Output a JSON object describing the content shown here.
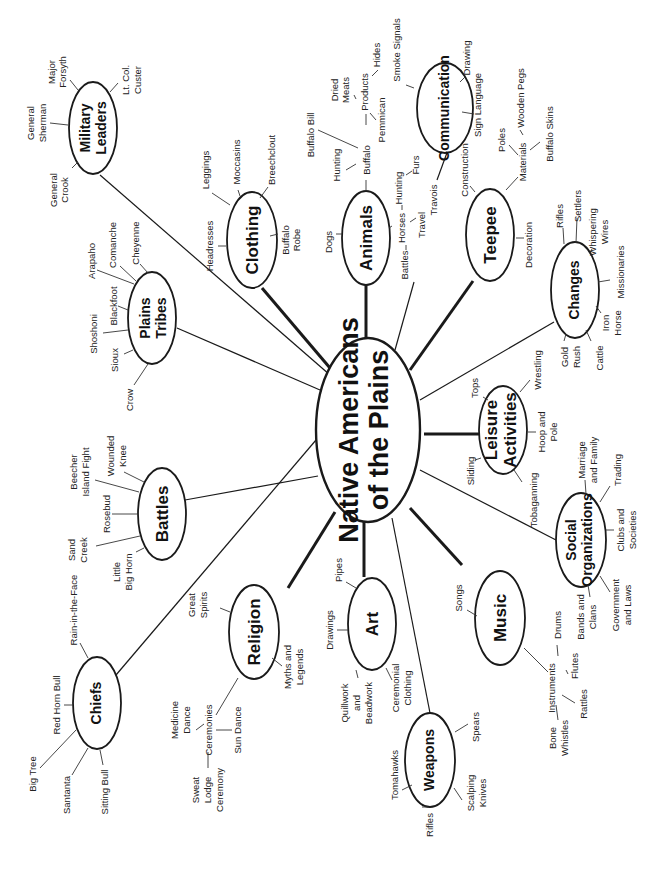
{
  "diagram": {
    "title_line1": "Native Americans",
    "title_line2": "of the Plains",
    "orientation": "rotated 90 degrees counter-clockwise",
    "colors": {
      "ink": "#1a1a1a",
      "background": "#ffffff"
    }
  },
  "nodes": {
    "military_leaders": {
      "line1": "Military",
      "line2": "Leaders",
      "children": [
        "General Crook",
        "General Sherman",
        "Major Forsyth",
        "Lt. Col. Custer"
      ]
    },
    "plains_tribes": {
      "line1": "Plains",
      "line2": "Tribes",
      "children": [
        "Crow",
        "Sioux",
        "Shoshoni",
        "Blackfoot",
        "Arapaho",
        "Comanche",
        "Cheyenne"
      ]
    },
    "clothing": {
      "label": "Clothing",
      "children": [
        "Headresses",
        "Leggings",
        "Moccasins",
        "Breechclout",
        "Buffalo Robe"
      ]
    },
    "animals": {
      "label": "Animals",
      "children": [
        "Dogs",
        "Buffalo",
        "Horses"
      ]
    },
    "buffalo": {
      "children": [
        "Hunting",
        "Buffalo Bill",
        "Products"
      ]
    },
    "products": {
      "children": [
        "Dried Meats",
        "Hides",
        "Pemmican"
      ]
    },
    "horses": {
      "children": [
        "Hunting",
        "Furs",
        "Travel",
        "Battles"
      ]
    },
    "travel": {
      "children": [
        "Travois"
      ]
    },
    "communication": {
      "label": "Communication",
      "children": [
        "Smoke Signals",
        "Drawing",
        "Sign Language"
      ]
    },
    "teepee": {
      "label": "Teepee",
      "children": [
        "Construction",
        "Materials",
        "Decoration"
      ]
    },
    "materials": {
      "children": [
        "Poles",
        "Wooden Pegs",
        "Buffalo Skins"
      ]
    },
    "changes": {
      "label": "Changes",
      "children": [
        "Rifles",
        "Settlers",
        "Whispering Wires",
        "Missionaries",
        "Iron Horse",
        "Cattle",
        "Gold Rush"
      ]
    },
    "leisure_activities": {
      "line1": "Leisure",
      "line2": "Activities",
      "children": [
        "Tops",
        "Wrestling",
        "Hoop and Pole",
        "Tobaganning",
        "Sliding"
      ]
    },
    "social_organizations": {
      "line1": "Social",
      "line2": "Organizations",
      "children": [
        "Marriage and Family",
        "Trading",
        "Clubs and Societies",
        "Government and Laws",
        "Bands and Clans"
      ]
    },
    "music": {
      "label": "Music",
      "children": [
        "Songs",
        "Instruments"
      ]
    },
    "instruments": {
      "children": [
        "Drums",
        "Flutes",
        "Rattles",
        "Bone Whistles"
      ]
    },
    "weapons": {
      "label": "Weapons",
      "children": [
        "Tomahawks",
        "Rifles",
        "Scalping Knives",
        "Spears"
      ]
    },
    "art": {
      "label": "Art",
      "children": [
        "Pipes",
        "Drawings",
        "Quillwork and Beadwork",
        "Ceremonial Clothing"
      ]
    },
    "religion": {
      "label": "Religion",
      "children": [
        "Great Spirits",
        "Myths and Legends",
        "Ceremonies"
      ]
    },
    "ceremonies": {
      "children": [
        "Medicine Dance",
        "Sweat Lodge Ceremony",
        "Sun Dance"
      ]
    },
    "battles": {
      "label": "Battles",
      "children": [
        "Sand Creek",
        "Rosebud",
        "Beecher Island Fight",
        "Wounded Knee",
        "Little Big Horn"
      ]
    },
    "chiefs": {
      "label": "Chiefs",
      "children": [
        "Rain-in-the-Face",
        "Red Horn Bull",
        "Big Tree",
        "Santanta",
        "Sitting Bull"
      ]
    }
  },
  "leaves": {
    "general_crook_1": "General",
    "general_crook_2": "Crook",
    "general_sherman_1": "General",
    "general_sherman_2": "Sherman",
    "major_forsyth_1": "Major",
    "major_forsyth_2": "Forsyth",
    "custer_1": "Lt. Col.",
    "custer_2": "Custer",
    "crow": "Crow",
    "sioux": "Sioux",
    "shoshoni": "Shoshoni",
    "blackfoot": "Blackfoot",
    "arapaho": "Arapaho",
    "comanche": "Comanche",
    "cheyenne": "Cheyenne",
    "headresses": "Headresses",
    "leggings": "Leggings",
    "moccasins": "Moccasins",
    "breechclout": "Breechclout",
    "buffalo_robe_1": "Buffalo",
    "buffalo_robe_2": "Robe",
    "dogs": "Dogs",
    "buffalo": "Buffalo",
    "hunting_a": "Hunting",
    "buffalo_bill": "Buffalo Bill",
    "products": "Products",
    "dried_meats_1": "Dried",
    "dried_meats_2": "Meats",
    "hides": "Hides",
    "pemmican": "Pemmican",
    "horses": "Horses",
    "hunting_b": "Hunting",
    "furs": "Furs",
    "travel": "Travel",
    "travois": "Travois",
    "battles_leaf": "Battles",
    "smoke_signals": "Smoke Signals",
    "drawing": "Drawing",
    "sign_language": "Sign Language",
    "construction": "Construction",
    "materials": "Materials",
    "poles": "Poles",
    "wooden_pegs": "Wooden Pegs",
    "buffalo_skins": "Buffalo Skins",
    "decoration": "Decoration",
    "rifles_c": "Rifles",
    "settlers": "Settlers",
    "whispering_1": "Whispering",
    "whispering_2": "Wires",
    "missionaries": "Missionaries",
    "iron_horse_1": "Iron",
    "iron_horse_2": "Horse",
    "cattle": "Cattle",
    "gold_rush_1": "Gold",
    "gold_rush_2": "Rush",
    "tops": "Tops",
    "wrestling": "Wrestling",
    "hoop_1": "Hoop and",
    "hoop_2": "Pole",
    "tobaganning": "Tobaganning",
    "sliding": "Sliding",
    "marriage_1": "Marriage",
    "marriage_2": "and Family",
    "trading": "Trading",
    "clubs_1": "Clubs and",
    "clubs_2": "Societies",
    "government_1": "Government",
    "government_2": "and Laws",
    "bands_1": "Bands and",
    "bands_2": "Clans",
    "songs": "Songs",
    "instruments": "Instruments",
    "drums": "Drums",
    "flutes": "Flutes",
    "rattles": "Rattles",
    "bone_1": "Bone",
    "bone_2": "Whistles",
    "tomahawks": "Tomahawks",
    "rifles_w": "Rifles",
    "scalping_1": "Scalping",
    "scalping_2": "Knives",
    "spears": "Spears",
    "pipes": "Pipes",
    "drawings": "Drawings",
    "quill_1": "Quillwork",
    "quill_2": "and",
    "quill_3": "Beadwork",
    "ceremonial_1": "Ceremonial",
    "ceremonial_2": "Clothing",
    "great_spirits_1": "Great",
    "great_spirits_2": "Spirits",
    "myths_1": "Myths and",
    "myths_2": "Legends",
    "ceremonies": "Ceremonies",
    "medicine_1": "Medicine",
    "medicine_2": "Dance",
    "sweat_1": "Sweat",
    "sweat_2": "Lodge",
    "sweat_3": "Ceremony",
    "sun_dance": "Sun Dance",
    "sand_creek_1": "Sand",
    "sand_creek_2": "Creek",
    "rosebud": "Rosebud",
    "beecher_1": "Beecher",
    "beecher_2": "Island Fight",
    "wounded_1": "Wounded",
    "wounded_2": "Knee",
    "little_1": "Little",
    "little_2": "Big Horn",
    "rain": "Rain-in-the-Face",
    "red_horn": "Red Horn Bull",
    "big_tree": "Big Tree",
    "santanta": "Santanta",
    "sitting_bull": "Sitting Bull"
  }
}
